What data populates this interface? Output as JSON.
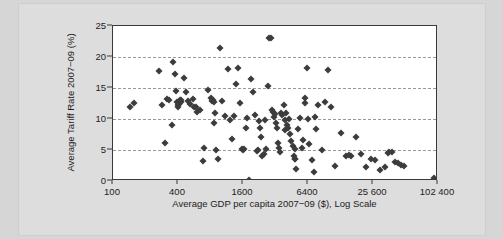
{
  "chart_data": {
    "type": "scatter",
    "title": "",
    "xlabel": "Average GDP per capita 2007−09 ($), Log Scale",
    "ylabel": "Average Tariff Rate 2007−09 (%)",
    "x_scale": "log",
    "x_log_base": 4,
    "xtick_labels": [
      "100",
      "400",
      "1600",
      "6400",
      "25 600",
      "102 400"
    ],
    "xtick_values": [
      100,
      400,
      1600,
      6400,
      25600,
      102400
    ],
    "ytick_labels": [
      "0",
      "5",
      "10",
      "15",
      "20",
      "25"
    ],
    "ytick_values": [
      0,
      5,
      10,
      15,
      20,
      25
    ],
    "xlim": [
      100,
      102400
    ],
    "ylim": [
      0,
      25
    ],
    "grid": "horizontal-dashed",
    "legend": "none",
    "marker": "diamond",
    "marker_color": "#3c3c3c",
    "point_count": 130,
    "points": [
      [
        145,
        12.0
      ],
      [
        158,
        12.6
      ],
      [
        268,
        17.8
      ],
      [
        285,
        12.3
      ],
      [
        300,
        6.2
      ],
      [
        318,
        13.2
      ],
      [
        330,
        13.0
      ],
      [
        352,
        9.0
      ],
      [
        362,
        19.2
      ],
      [
        372,
        17.3
      ],
      [
        380,
        14.5
      ],
      [
        388,
        12.8
      ],
      [
        396,
        12.2
      ],
      [
        404,
        11.9
      ],
      [
        412,
        12.4
      ],
      [
        420,
        13.0
      ],
      [
        430,
        12.7
      ],
      [
        452,
        16.6
      ],
      [
        470,
        14.4
      ],
      [
        500,
        12.9
      ],
      [
        520,
        12.4
      ],
      [
        545,
        13.2
      ],
      [
        560,
        11.9
      ],
      [
        600,
        11.2
      ],
      [
        640,
        11.4
      ],
      [
        680,
        3.3
      ],
      [
        700,
        5.4
      ],
      [
        760,
        14.6
      ],
      [
        800,
        13.4
      ],
      [
        820,
        12.9
      ],
      [
        840,
        13.1
      ],
      [
        860,
        9.4
      ],
      [
        880,
        10.9
      ],
      [
        900,
        5.0
      ],
      [
        940,
        3.6
      ],
      [
        980,
        21.4
      ],
      [
        1020,
        12.9
      ],
      [
        1080,
        10.5
      ],
      [
        1150,
        18.1
      ],
      [
        1200,
        9.9
      ],
      [
        1260,
        6.8
      ],
      [
        1380,
        15.7
      ],
      [
        1450,
        18.2
      ],
      [
        1500,
        12.6
      ],
      [
        1560,
        5.2
      ],
      [
        1600,
        5.0
      ],
      [
        1640,
        5.1
      ],
      [
        1700,
        8.5
      ],
      [
        1760,
        10.1
      ],
      [
        1800,
        0.2
      ],
      [
        1900,
        16.4
      ],
      [
        1980,
        14.4
      ],
      [
        2050,
        10.6
      ],
      [
        2150,
        4.8
      ],
      [
        2200,
        5.0
      ],
      [
        2300,
        8.5
      ],
      [
        2360,
        7.1
      ],
      [
        2420,
        4.0
      ],
      [
        2480,
        4.3
      ],
      [
        2560,
        9.8
      ],
      [
        2640,
        5.2
      ],
      [
        2720,
        15.4
      ],
      [
        2800,
        23.0
      ],
      [
        2880,
        23.1
      ],
      [
        2960,
        11.4
      ],
      [
        3020,
        11.2
      ],
      [
        3100,
        10.3
      ],
      [
        3200,
        9.3
      ],
      [
        3280,
        8.6
      ],
      [
        3350,
        6.2
      ],
      [
        3420,
        5.4
      ],
      [
        3500,
        4.6
      ],
      [
        3600,
        11.0
      ],
      [
        3700,
        10.6
      ],
      [
        3800,
        12.2
      ],
      [
        3900,
        9.8
      ],
      [
        4000,
        10.9
      ],
      [
        4100,
        9.0
      ],
      [
        4200,
        8.6
      ],
      [
        4300,
        10.0
      ],
      [
        4400,
        7.6
      ],
      [
        4500,
        6.5
      ],
      [
        4600,
        5.6
      ],
      [
        4700,
        4.0
      ],
      [
        4800,
        3.6
      ],
      [
        4900,
        3.5
      ],
      [
        5000,
        2.0
      ],
      [
        5200,
        8.4
      ],
      [
        5400,
        10.1
      ],
      [
        5600,
        5.3
      ],
      [
        5800,
        6.6
      ],
      [
        6000,
        13.4
      ],
      [
        6200,
        18.2
      ],
      [
        6400,
        10.0
      ],
      [
        6600,
        6.0
      ],
      [
        6900,
        3.4
      ],
      [
        7200,
        1.5
      ],
      [
        7600,
        8.4
      ],
      [
        8000,
        12.3
      ],
      [
        8600,
        5.0
      ],
      [
        9200,
        12.8
      ],
      [
        9800,
        17.9
      ],
      [
        10500,
        12.0
      ],
      [
        11500,
        2.4
      ],
      [
        13000,
        7.7
      ],
      [
        14500,
        4.1
      ],
      [
        16000,
        4.0
      ],
      [
        18000,
        7.1
      ],
      [
        20000,
        4.3
      ],
      [
        22000,
        2.3
      ],
      [
        24500,
        3.6
      ],
      [
        27000,
        3.4
      ],
      [
        30000,
        1.8
      ],
      [
        33000,
        2.2
      ],
      [
        36000,
        4.6
      ],
      [
        38000,
        4.7
      ],
      [
        41000,
        3.1
      ],
      [
        44000,
        2.9
      ],
      [
        47000,
        2.6
      ],
      [
        50000,
        2.5
      ],
      [
        95000,
        0.5
      ],
      [
        430,
        13.1
      ],
      [
        590,
        12.0
      ],
      [
        860,
        12.8
      ],
      [
        1320,
        10.5
      ],
      [
        2240,
        9.6
      ],
      [
        3140,
        10.8
      ],
      [
        3960,
        8.3
      ],
      [
        4840,
        5.2
      ],
      [
        6050,
        12.6
      ],
      [
        7400,
        10.4
      ],
      [
        15500,
        4.2
      ],
      [
        35000,
        4.5
      ]
    ]
  }
}
